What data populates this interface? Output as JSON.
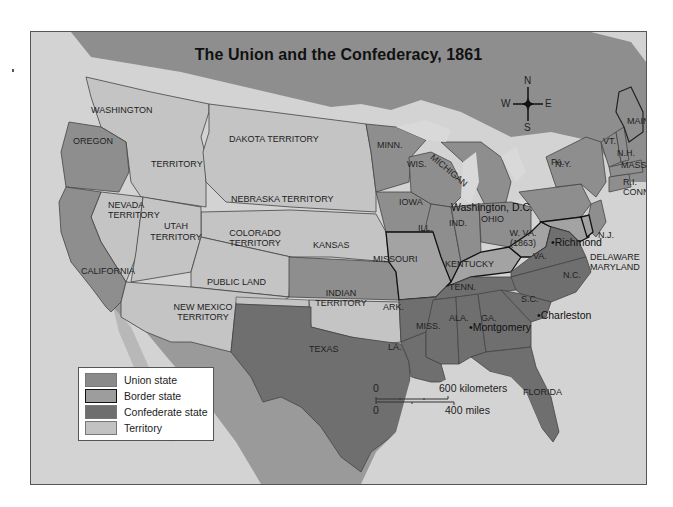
{
  "title": "The Union and the Confederacy, 1861",
  "colors": {
    "union": "#8e8e8e",
    "border": "#a3a3a3",
    "confederate": "#6f6f6f",
    "territory": "#c4c4c4",
    "foreign": "#9a9a9a",
    "water": "#d6d6d6",
    "legend_union": "#8a8a8a",
    "legend_border": "#9d9d9d",
    "legend_confederate": "#6e6e6e",
    "legend_territory": "#c2c2c2"
  },
  "compass": {
    "n": "N",
    "s": "S",
    "e": "E",
    "w": "W"
  },
  "labels": {
    "washington": "WASHINGTON",
    "washington_territory": "TERRITORY",
    "oregon": "OREGON",
    "dakota": "DAKOTA TERRITORY",
    "nebraska": "NEBRASKA TERRITORY",
    "nevada": "NEVADA\nTERRITORY",
    "nevada_1": "NEVADA",
    "nevada_2": "TERRITORY",
    "utah_1": "UTAH",
    "utah_2": "TERRITORY",
    "colorado_1": "COLORADO",
    "colorado_2": "TERRITORY",
    "california": "CALIFORNIA",
    "kansas": "KANSAS",
    "public_land": "PUBLIC LAND",
    "new_mexico_1": "NEW MEXICO",
    "new_mexico_2": "TERRITORY",
    "indian_1": "INDIAN",
    "indian_2": "TERRITORY",
    "texas": "TEXAS",
    "minn": "MINN.",
    "wis": "WIS.",
    "michigan": "MICHIGAN",
    "iowa": "IOWA",
    "ill": "ILL.",
    "ind": "IND.",
    "ohio": "OHIO",
    "missouri": "MISSOURI",
    "kentucky": "KENTUCKY",
    "wva_1": "W. VA.",
    "wva_2": "(1863)",
    "va": "VA.",
    "nc": "N.C.",
    "tenn": "TENN.",
    "sc": "S.C.",
    "ark": "ARK.",
    "miss": "MISS.",
    "ala": "ALA.",
    "ga": "GA.",
    "la": "LA.",
    "florida": "FLORIDA",
    "pa": "PA.",
    "ny": "N.Y.",
    "nj": "N.J.",
    "vt": "VT.",
    "nh": "N.H.",
    "maine": "MAINE",
    "mass": "MASS.",
    "ri": "R.I.",
    "conn": "CONN.",
    "delaware": "DELAWARE",
    "maryland": "MARYLAND"
  },
  "cities": {
    "washington_dc": "Washington, D.C.",
    "richmond": "•Richmond",
    "charleston": "•Charleston",
    "montgomery": "•Montgomery"
  },
  "legend": {
    "items": [
      {
        "label": "Union state",
        "category": "union"
      },
      {
        "label": "Border state",
        "category": "border"
      },
      {
        "label": "Confederate state",
        "category": "confederate"
      },
      {
        "label": "Territory",
        "category": "territory"
      }
    ]
  },
  "scale": {
    "km_zero": "0",
    "km_label": "600 kilometers",
    "mi_zero": "0",
    "mi_label": "400 miles"
  }
}
